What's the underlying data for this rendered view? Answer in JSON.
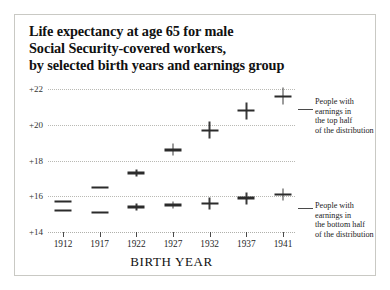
{
  "chart_data": {
    "type": "scatter",
    "title": "Life expectancy at age 65 for male Social Security-covered workers, by selected birth years and earnings group",
    "title_lines": [
      "Life expectancy at age 65 for male",
      "Social Security-covered workers,",
      "by selected birth years and earnings group"
    ],
    "xlabel": "BIRTH YEAR",
    "ylabel": "",
    "categories": [
      "1912",
      "1917",
      "1922",
      "1927",
      "1932",
      "1937",
      "1941"
    ],
    "x": [
      1912,
      1917,
      1922,
      1927,
      1932,
      1937,
      1941
    ],
    "ylim": [
      14,
      22.8
    ],
    "yticks": [
      14,
      16,
      18,
      20,
      22
    ],
    "ytick_labels": [
      "+14",
      "+16",
      "+18",
      "+20",
      "+22"
    ],
    "grid": true,
    "legend_position": "right-annotations",
    "series": [
      {
        "name": "People with earnings in the top half of the distribution",
        "values": [
          15.7,
          16.5,
          17.3,
          18.6,
          19.7,
          20.8,
          21.6
        ]
      },
      {
        "name": "People with earnings in the bottom half of the distribution",
        "values": [
          15.2,
          15.1,
          15.4,
          15.5,
          15.6,
          15.9,
          16.1
        ]
      }
    ],
    "annotations": [
      {
        "id": "top",
        "lines": [
          "People with",
          "earnings in",
          "the top half",
          "of the distribution"
        ]
      },
      {
        "id": "bottom",
        "lines": [
          "People with",
          "earnings in",
          "the bottom half",
          "of the distribution"
        ]
      }
    ]
  },
  "colors": {
    "marker": "#2b2b2b",
    "gridline": "#b9b9b4",
    "text": "#111111",
    "frame": "#c9c9c4",
    "background": "#ffffff"
  }
}
